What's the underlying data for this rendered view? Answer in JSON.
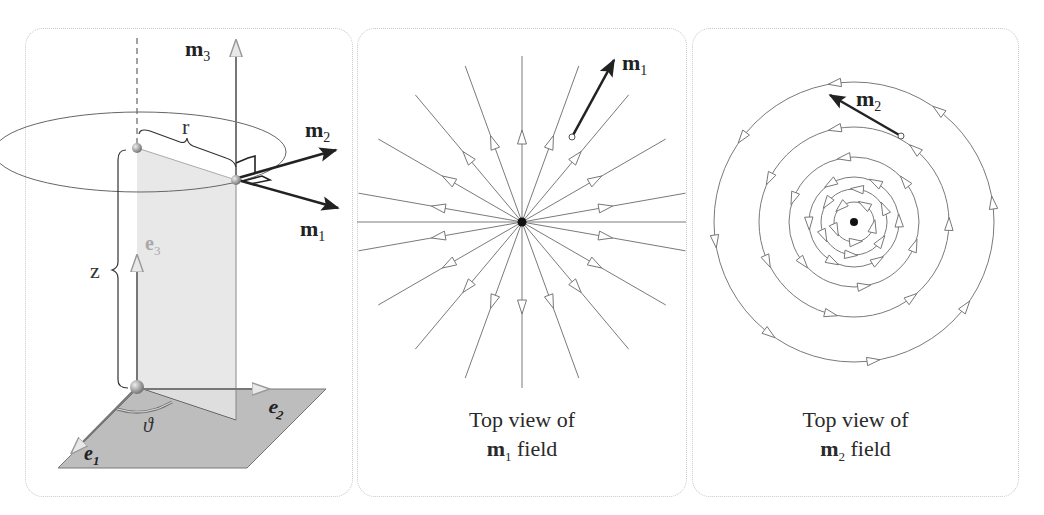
{
  "panels": [
    {
      "id": "cylindrical-frame",
      "labels": {
        "m3": "m",
        "m3_sub": "3",
        "m2": "m",
        "m2_sub": "2",
        "m1": "m",
        "m1_sub": "1",
        "r": "r",
        "z": "z",
        "e3": "e",
        "e3_sub": "3",
        "e1": "e",
        "e1_sub": "1",
        "e2": "e",
        "e2_sub": "2",
        "theta": "ϑ"
      }
    },
    {
      "id": "m1-field",
      "vector_label": "m",
      "vector_sub": "1",
      "caption_line1": "Top view of",
      "caption_vec": "m",
      "caption_sub": "1",
      "caption_rest": " field",
      "radial_line_count": 18
    },
    {
      "id": "m2-field",
      "vector_label": "m",
      "vector_sub": "2",
      "caption_line1": "Top view of",
      "caption_vec": "m",
      "caption_sub": "2",
      "caption_rest": " field",
      "circle_count": 6
    }
  ],
  "colors": {
    "line": "#6f6f6f",
    "dark": "#222222",
    "plane": "#bdbdbd",
    "shade": "#e6e6e6",
    "light_label": "#a8a8a8",
    "border": "#c9c9c9"
  }
}
